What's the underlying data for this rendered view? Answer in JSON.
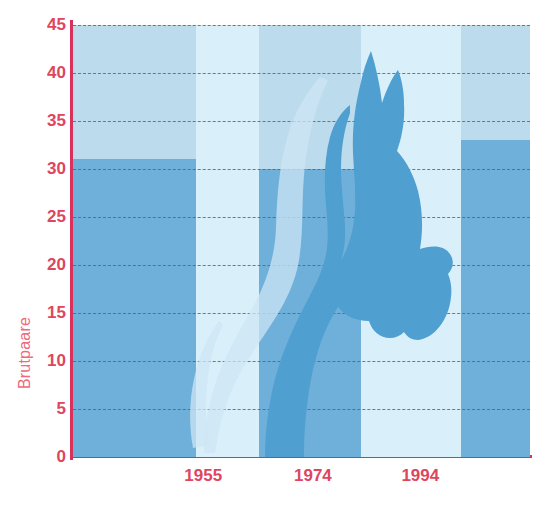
{
  "chart_data": {
    "type": "bar",
    "title": "",
    "subtitle": "",
    "xlabel": "",
    "ylabel": "Brutpaare",
    "ylim": [
      0,
      45
    ],
    "y_ticks": [
      0,
      5,
      10,
      15,
      20,
      25,
      30,
      35,
      40,
      45
    ],
    "grid": true,
    "legend": null,
    "x_tick_labels": [
      "1955",
      "1974",
      "1994"
    ],
    "x_tick_positions_pct": [
      28.5,
      52.5,
      76.0
    ],
    "categories": [
      "1940",
      "1955",
      "1974",
      "1994",
      "2000"
    ],
    "values": [
      31,
      0,
      30,
      40.5,
      33
    ],
    "bars": [
      {
        "label": "1940",
        "value": 31,
        "left_pct": 0.0,
        "width_pct": 27.0,
        "shade": "dark"
      },
      {
        "label": "1955",
        "value": 0,
        "left_pct": 27.0,
        "width_pct": 13.6,
        "shade": "light"
      },
      {
        "label": "1974",
        "value": 30,
        "left_pct": 40.6,
        "width_pct": 22.5,
        "shade": "dark"
      },
      {
        "label": "1994",
        "value": 40.5,
        "left_pct": 63.1,
        "width_pct": 21.9,
        "shade": "light"
      },
      {
        "label": "2000",
        "value": 33,
        "left_pct": 85.0,
        "width_pct": 15.0,
        "shade": "dark"
      }
    ],
    "annotations": [
      {
        "name": "bird-silhouette",
        "description": "Stylised bird (crested head and long neck) overlaid across the plot"
      },
      {
        "name": "bird-ghost-silhouette",
        "description": "Pale lighter duplicate of the bird offset to the lower left"
      }
    ]
  },
  "colors": {
    "plot_background": "#bcdcee",
    "bar_dark": "#6fb0da",
    "bar_light": "#d9effa",
    "axis": "#d8315b",
    "tick_text": "#e0455f",
    "axis_label_text": "#ef6a7e",
    "gridline": "#5b5f8f",
    "bird": "#4f9fd0",
    "bird_ghost": "#cde6f4",
    "page_background": "#ffffff"
  },
  "icons": {
    "bird": "bird-silhouette-icon"
  }
}
